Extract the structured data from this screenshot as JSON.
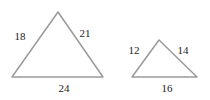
{
  "figure": {
    "type": "geometry-diagram",
    "background_color": "#ffffff",
    "stroke_color": "#9a9a9a",
    "stroke_width": 1.5,
    "label_color": "#1c1c1c",
    "label_font_size": 11
  },
  "shapes": [
    {
      "name": "large-triangle",
      "vertices": {
        "apex": {
          "x": 58,
          "y": 12
        },
        "bottom_left": {
          "x": 12,
          "y": 77
        },
        "bottom_right": {
          "x": 103,
          "y": 77
        }
      },
      "sides": [
        {
          "name": "left-side",
          "label": "18",
          "label_x": 20,
          "label_y": 37
        },
        {
          "name": "right-side",
          "label": "21",
          "label_x": 85,
          "label_y": 34
        },
        {
          "name": "base",
          "label": "24",
          "label_x": 64,
          "label_y": 89
        }
      ]
    },
    {
      "name": "small-triangle",
      "vertices": {
        "apex": {
          "x": 159,
          "y": 40
        },
        "bottom_left": {
          "x": 132,
          "y": 77
        },
        "bottom_right": {
          "x": 197,
          "y": 77
        }
      },
      "sides": [
        {
          "name": "left-side",
          "label": "12",
          "label_x": 134,
          "label_y": 51
        },
        {
          "name": "right-side",
          "label": "14",
          "label_x": 183,
          "label_y": 51
        },
        {
          "name": "base",
          "label": "16",
          "label_x": 167,
          "label_y": 89
        }
      ]
    }
  ],
  "chart_data": {
    "type": "diagram",
    "title": "",
    "items": [
      {
        "shape": "triangle",
        "name": "large-triangle",
        "side_lengths": [
          18,
          21,
          24
        ],
        "side_label_positions": [
          "left",
          "right",
          "bottom"
        ]
      },
      {
        "shape": "triangle",
        "name": "small-triangle",
        "side_lengths": [
          12,
          14,
          16
        ],
        "side_label_positions": [
          "left",
          "right",
          "bottom"
        ]
      }
    ]
  }
}
